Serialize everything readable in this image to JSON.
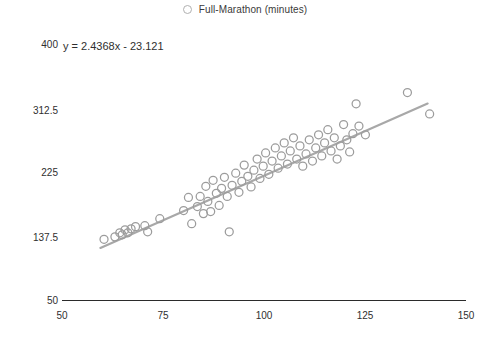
{
  "legend": {
    "marker_icon": "open-circle-marker",
    "label": "Full-Marathon (minutes)"
  },
  "annotation": {
    "equation": "y = 2.4368x - 23.121"
  },
  "axes": {
    "y_ticks": [
      "400",
      "312.5",
      "225",
      "137.5",
      "50"
    ],
    "x_ticks": [
      "50",
      "75",
      "100",
      "125",
      "150"
    ]
  },
  "colors": {
    "marker": "#9c9c9c",
    "trendline": "#a8a8a8",
    "axis": "#2b2b2b",
    "text": "#2f2f2f",
    "background": "#ffffff"
  },
  "chart_data": {
    "type": "scatter",
    "title": "",
    "subtitle": "",
    "xlabel": "",
    "ylabel": "",
    "xlim": [
      50,
      150
    ],
    "ylim": [
      50,
      400
    ],
    "grid": false,
    "legend_position": "top-center",
    "xticks": [
      50,
      75,
      100,
      125,
      150
    ],
    "yticks": [
      50,
      137.5,
      225,
      312.5,
      400
    ],
    "series": [
      {
        "name": "Full-Marathon (minutes)",
        "marker": "open-circle",
        "color": "#9c9c9c",
        "points": [
          [
            60.4,
            133.6
          ],
          [
            63.1,
            137.0
          ],
          [
            64.3,
            142.5
          ],
          [
            64.9,
            139.8
          ],
          [
            65.6,
            146.6
          ],
          [
            66.3,
            142.5
          ],
          [
            67.1,
            148.0
          ],
          [
            68.2,
            151.0
          ],
          [
            70.5,
            152.3
          ],
          [
            71.2,
            143.9
          ],
          [
            74.2,
            161.9
          ],
          [
            80.1,
            173.0
          ],
          [
            81.3,
            190.9
          ],
          [
            82.1,
            155.0
          ],
          [
            83.5,
            178.5
          ],
          [
            84.2,
            192.3
          ],
          [
            85.0,
            168.8
          ],
          [
            85.6,
            206.1
          ],
          [
            86.1,
            185.4
          ],
          [
            86.8,
            171.6
          ],
          [
            87.4,
            214.3
          ],
          [
            88.2,
            196.5
          ],
          [
            88.9,
            180.0
          ],
          [
            89.5,
            203.3
          ],
          [
            90.2,
            218.4
          ],
          [
            90.9,
            192.3
          ],
          [
            91.4,
            144.0
          ],
          [
            92.1,
            207.5
          ],
          [
            93.0,
            224.0
          ],
          [
            93.8,
            198.0
          ],
          [
            94.5,
            212.9
          ],
          [
            95.1,
            235.1
          ],
          [
            96.0,
            219.8
          ],
          [
            96.8,
            205.2
          ],
          [
            97.5,
            228.2
          ],
          [
            98.3,
            243.4
          ],
          [
            99.0,
            216.9
          ],
          [
            99.8,
            233.7
          ],
          [
            100.4,
            251.7
          ],
          [
            101.2,
            222.6
          ],
          [
            102.0,
            240.6
          ],
          [
            102.8,
            258.6
          ],
          [
            103.5,
            230.9
          ],
          [
            104.3,
            247.6
          ],
          [
            105.0,
            265.5
          ],
          [
            105.8,
            236.5
          ],
          [
            106.5,
            254.5
          ],
          [
            107.3,
            272.5
          ],
          [
            108.1,
            243.4
          ],
          [
            108.9,
            261.4
          ],
          [
            109.6,
            233.7
          ],
          [
            110.4,
            250.3
          ],
          [
            111.2,
            269.7
          ],
          [
            112.0,
            240.6
          ],
          [
            112.8,
            258.6
          ],
          [
            113.5,
            276.6
          ],
          [
            114.3,
            247.6
          ],
          [
            115.0,
            265.5
          ],
          [
            115.8,
            283.5
          ],
          [
            116.6,
            254.5
          ],
          [
            117.4,
            272.5
          ],
          [
            118.1,
            243.4
          ],
          [
            118.9,
            261.4
          ],
          [
            119.7,
            290.5
          ],
          [
            120.5,
            269.7
          ],
          [
            121.2,
            253.1
          ],
          [
            122.0,
            278.0
          ],
          [
            122.8,
            319.0
          ],
          [
            123.5,
            288.5
          ],
          [
            125.1,
            276.6
          ],
          [
            135.5,
            334.3
          ],
          [
            141.0,
            305.0
          ]
        ]
      }
    ],
    "trendline": {
      "equation": "y = 2.4368x - 23.121",
      "slope": 2.4368,
      "intercept": -23.121,
      "x_start": 59.5,
      "x_end": 140.5,
      "color": "#a8a8a8"
    }
  }
}
